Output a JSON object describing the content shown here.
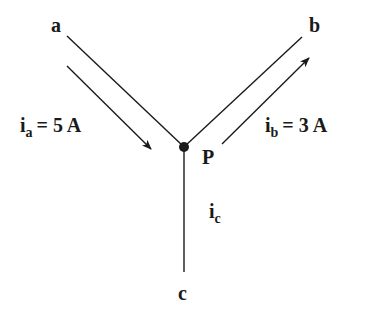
{
  "diagram": {
    "type": "circuit-node",
    "node": {
      "label": "P"
    },
    "branches": [
      {
        "terminal": "a",
        "current_symbol": "i",
        "current_sub": "a",
        "current_value": "= 5 A",
        "direction": "into P"
      },
      {
        "terminal": "b",
        "current_symbol": "i",
        "current_sub": "b",
        "current_value": "= 3 A",
        "direction": "out of P"
      },
      {
        "terminal": "c",
        "current_symbol": "i",
        "current_sub": "c",
        "current_value": "",
        "direction": "unknown"
      }
    ],
    "colors": {
      "line": "#1a1a1a",
      "background": "#ffffff"
    }
  }
}
